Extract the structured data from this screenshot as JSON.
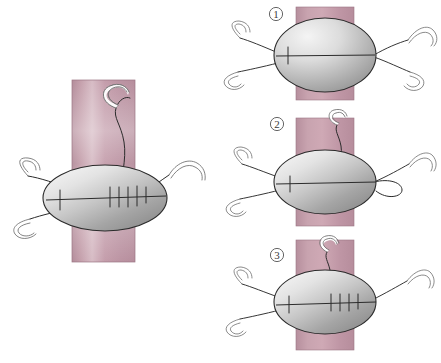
{
  "figure": {
    "background_color": "#ffffff"
  },
  "colors": {
    "tissue_band": "#c19aa6",
    "tissue_band_highlight": "#d9bcc4",
    "tissue_band_shadow": "#ab8391",
    "defect_fill_light": "#e9e9e9",
    "defect_fill_mid": "#b8b8b8",
    "defect_fill_dark": "#8f8f8f",
    "thread": "#2b2b2b",
    "needle_outline": "#6b6b6b",
    "needle_fill": "#ffffff",
    "label_text": "#3a3a3a"
  },
  "main_panel": {
    "name": "main-overview",
    "band": {
      "x": 72,
      "y": 80,
      "width": 63,
      "height": 182
    },
    "defect": {
      "cx": 105,
      "cy": 198,
      "rx": 62,
      "ry": 33
    },
    "suture_ticks": 6,
    "needle_count": 3,
    "loop_count": 1,
    "caption": ""
  },
  "steps": [
    {
      "id": "step-1",
      "label": "①",
      "number": "1",
      "band": {
        "x": 296,
        "y": 7,
        "width": 58,
        "height": 93
      },
      "defect": {
        "cx": 325,
        "cy": 55,
        "rx": 51,
        "ry": 37
      },
      "suture_ticks": 1,
      "needles": 4,
      "description": "Four stay sutures placed at the corners of the oval defect; needles still attached."
    },
    {
      "id": "step-2",
      "label": "②",
      "number": "2",
      "band": {
        "x": 296,
        "y": 118,
        "width": 58,
        "height": 108
      },
      "defect": {
        "cx": 325,
        "cy": 182,
        "rx": 51,
        "ry": 32
      },
      "suture_ticks": 1,
      "needles": 4,
      "description": "Running suture begun; needle passes from above and a loop is drawn out to the right."
    },
    {
      "id": "step-3",
      "label": "③",
      "number": "3",
      "band": {
        "x": 296,
        "y": 240,
        "width": 58,
        "height": 110
      },
      "defect": {
        "cx": 325,
        "cy": 302,
        "rx": 51,
        "ry": 32
      },
      "suture_ticks": 5,
      "needles": 3,
      "description": "Running suture continued across the defect producing a row of transverse stitches."
    }
  ],
  "elements": {
    "tissue_band_name": "tissue-band",
    "defect_name": "oval-defect",
    "thread_name": "suture-thread",
    "needle_name": "curved-needle",
    "loop_name": "suture-loop",
    "tick_name": "stitch-tick"
  }
}
